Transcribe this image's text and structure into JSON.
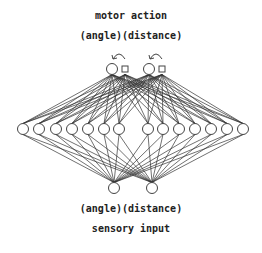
{
  "top": {
    "title": "motor action",
    "sublabel": "(angle)(distance)"
  },
  "bottom": {
    "sublabel": "(angle)(distance)",
    "title": "sensory input"
  },
  "network": {
    "output_units": [
      {
        "x": 112,
        "y": 69,
        "kind": "circle"
      },
      {
        "x": 149,
        "y": 69,
        "kind": "circle"
      }
    ],
    "output_recurrent_squares": [
      {
        "x": 125,
        "y": 69
      },
      {
        "x": 162,
        "y": 69
      }
    ],
    "hidden_units_x": [
      23,
      39,
      56,
      72,
      88,
      104,
      119,
      148,
      163,
      179,
      195,
      211,
      227,
      243
    ],
    "hidden_y": 129,
    "input_units": [
      {
        "x": 114,
        "y": 188
      },
      {
        "x": 152,
        "y": 188
      }
    ],
    "colors": {
      "line": "#333333",
      "node": "#444444",
      "background": "#ffffff"
    }
  }
}
